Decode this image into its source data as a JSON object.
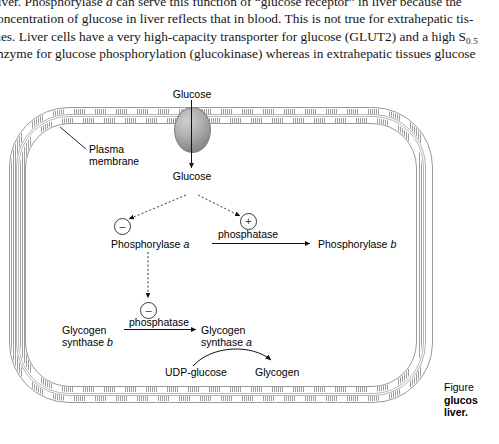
{
  "page": {
    "body_text_lines": [
      "liver. Phosphorylase a can serve this function of “glucose receptor” in liver because the",
      "concentration of glucose in liver reflects that in blood. This is not true for extrahepatic tis-",
      "sues. Liver cells have a very high-capacity transporter for glucose (GLUT2) and a high S0.5",
      "enzyme for glucose phosphorylation (glucokinase) whereas in extrahepatic tissues glucose"
    ],
    "line1": {
      "a": "liver. Phosphorylase ",
      "italic": "a",
      "b": " can serve this function of “glucose receptor” in liver because the"
    },
    "line2": "concentration of glucose in liver reflects that in blood. This is not true for extrahepatic tis-",
    "line3": {
      "a": "sues. Liver cells have a very high-capacity transporter for glucose (GLUT2) and a high S",
      "sub": "0.5"
    },
    "line4": "enzyme for glucose phosphorylation (glucokinase) whereas in extrahepatic tissues glucose"
  },
  "figure": {
    "labels": {
      "glucose_out": "Glucose",
      "glucose_in": "Glucose",
      "plasma_membrane_1": "Plasma",
      "plasma_membrane_2": "membrane",
      "phosphorylase_a_text": "Phosphorylase ",
      "phosphorylase_a_italic": "a",
      "phosphorylase_b_text": "Phosphorylase ",
      "phosphorylase_b_italic": "b",
      "phosphatase_top": "phosphatase",
      "phosphatase_bottom": "phosphatase",
      "glycogen_synthase_b_l1": "Glycogen",
      "glycogen_synthase_b_l2_text": "synthase ",
      "glycogen_synthase_b_l2_italic": "b",
      "glycogen_synthase_a_l1": "Glycogen",
      "glycogen_synthase_a_l2_text": "synthase ",
      "glycogen_synthase_a_l2_italic": "a",
      "udp_glucose": "UDP-glucose",
      "glycogen": "Glycogen"
    },
    "signs": {
      "minus_phosphorylase": "–",
      "plus_phosphorylase": "+",
      "minus_synthase": "–"
    },
    "caption": {
      "line1": "Figure",
      "line2": "glucos",
      "line3": "liver."
    }
  },
  "colors": {
    "membrane_line": "#9a9a9a",
    "transporter": "#9b9b9b",
    "text": "#000000",
    "prose": "#161616"
  }
}
